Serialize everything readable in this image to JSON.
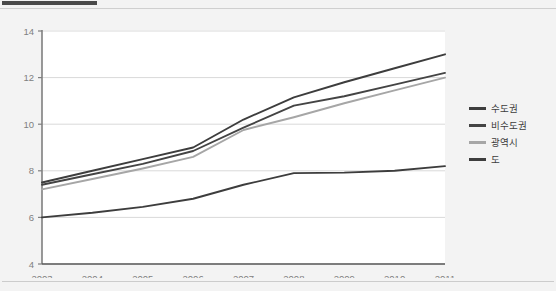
{
  "page": {
    "background_color": "#f3f3f3",
    "accent_bar_color": "#4a4a4a",
    "rule_color": "#cfcfcf"
  },
  "legend": {
    "position": "right",
    "items": [
      {
        "label": "수도권",
        "color": "#3d3d3d"
      },
      {
        "label": "비수도권",
        "color": "#444444"
      },
      {
        "label": "광역시",
        "color": "#a6a6a6"
      },
      {
        "label": "도",
        "color": "#3d3d3d"
      }
    ]
  },
  "chart_data": {
    "type": "line",
    "title": "",
    "subtitle": "",
    "xlabel": "",
    "ylabel": "",
    "x": [
      "2003",
      "2004",
      "2005",
      "2006",
      "2007",
      "2008",
      "2009",
      "2010",
      "2011"
    ],
    "categories": [
      "2003",
      "2004",
      "2005",
      "2006",
      "2007",
      "2008",
      "2009",
      "2010",
      "2011"
    ],
    "xtick_labels": [
      "2003",
      "2004",
      "2005",
      "2006",
      "2007",
      "2008",
      "2009",
      "2010",
      "2011"
    ],
    "ytick_labels": [
      "4",
      "6",
      "8",
      "10",
      "12",
      "14"
    ],
    "yticks": [
      4,
      6,
      8,
      10,
      12,
      14
    ],
    "ylim": [
      4,
      14
    ],
    "grid": "horizontal",
    "legend_position": "right",
    "plot_background": "#ffffff",
    "gridline_color": "#d9d9d9",
    "axis_color": "#7f7f7f",
    "series": [
      {
        "name": "수도권",
        "color": "#3d3d3d",
        "values": [
          7.5,
          8.0,
          8.5,
          9.0,
          10.2,
          11.15,
          11.8,
          12.4,
          13.0
        ]
      },
      {
        "name": "비수도권",
        "color": "#444444",
        "values": [
          7.4,
          7.85,
          8.3,
          8.85,
          9.85,
          10.8,
          11.2,
          11.7,
          12.2
        ]
      },
      {
        "name": "광역시",
        "color": "#a6a6a6",
        "values": [
          7.2,
          7.65,
          8.1,
          8.6,
          9.75,
          10.3,
          10.9,
          11.45,
          12.0
        ]
      },
      {
        "name": "도",
        "color": "#3d3d3d",
        "values": [
          6.0,
          6.2,
          6.45,
          6.8,
          7.4,
          7.9,
          7.92,
          8.0,
          8.2
        ]
      }
    ]
  }
}
